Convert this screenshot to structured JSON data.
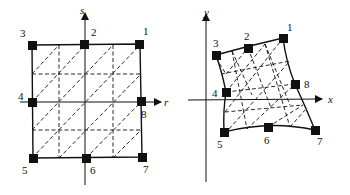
{
  "figure_left": {
    "title": "parent element (r, s)",
    "axes": {
      "horizontal": "r",
      "vertical": "s"
    },
    "nodes": [
      {
        "label": "1"
      },
      {
        "label": "2"
      },
      {
        "label": "3"
      },
      {
        "label": "4"
      },
      {
        "label": "5"
      },
      {
        "label": "6"
      },
      {
        "label": "7"
      },
      {
        "label": "8"
      }
    ]
  },
  "figure_right": {
    "title": "mapped element (x, y)",
    "axes": {
      "horizontal": "x",
      "vertical": "y"
    },
    "nodes": [
      {
        "label": "1"
      },
      {
        "label": "2"
      },
      {
        "label": "3"
      },
      {
        "label": "4"
      },
      {
        "label": "5"
      },
      {
        "label": "6"
      },
      {
        "label": "7"
      },
      {
        "label": "8"
      }
    ]
  },
  "colors": {
    "ink": "#111111",
    "background": "#ffffff"
  }
}
